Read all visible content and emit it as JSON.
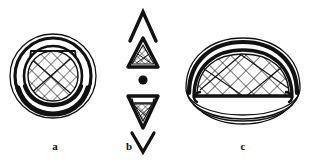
{
  "plate": {
    "background_color": "#ffffff",
    "ink_color": "#111111",
    "hatch_color": "#1a1a1a",
    "description": "Line drawing plate of an artifact in three views with cross-hatched net decoration"
  },
  "panels": [
    {
      "id": "a",
      "label": "a",
      "view": "plan-view-circular",
      "motif": "cross-hatch-lattice",
      "rings": 4,
      "center_fill": "cross-hatch"
    },
    {
      "id": "b",
      "label": "b",
      "view": "side-profile-pointed",
      "motif": "cross-hatch-lattice",
      "elements": [
        "upper-chevron",
        "upper-triangle",
        "center-dot",
        "lower-triangle",
        "lower-chevron"
      ],
      "center_fill": "cross-hatch"
    },
    {
      "id": "c",
      "label": "c",
      "view": "elevation-oval",
      "motif": "cross-hatch-lattice",
      "rings": 3,
      "center_fill": "cross-hatch"
    }
  ]
}
